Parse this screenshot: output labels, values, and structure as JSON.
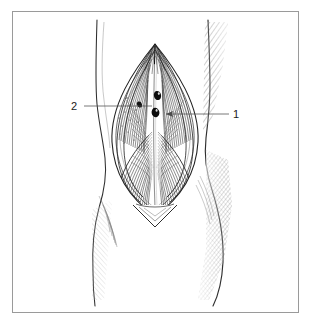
{
  "figure": {
    "kind": "anatomical-line-illustration",
    "background_color": "#ffffff",
    "ink_color": "#1a1a1a",
    "border": {
      "present": true,
      "color": "#9a9a9a",
      "width_px": 1,
      "x": 12,
      "y": 11,
      "width": 287,
      "height": 302
    },
    "labels": [
      {
        "id": "label-1",
        "text": "1",
        "x": 234,
        "y": 118,
        "leader": {
          "from_x": 229,
          "from_y": 114,
          "to_x": 163,
          "to_y": 114,
          "arrow": true
        }
      },
      {
        "id": "label-2",
        "text": "2",
        "x": 75,
        "y": 110,
        "leader": {
          "from_x": 84,
          "from_y": 106,
          "to_x": 152,
          "to_y": 106,
          "arrow": false
        }
      }
    ],
    "structures": [
      {
        "name": "left-limb-contour"
      },
      {
        "name": "right-limb-contour"
      },
      {
        "name": "skin-incision-margin"
      },
      {
        "name": "retracted-fascia"
      },
      {
        "name": "muscle-bellies"
      },
      {
        "name": "neurovascular-bundle"
      }
    ]
  }
}
